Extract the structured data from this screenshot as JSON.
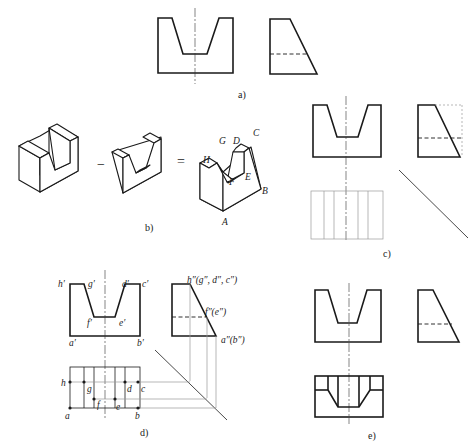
{
  "figure": {
    "panels": [
      {
        "id": "a",
        "caption": "a)"
      },
      {
        "id": "b",
        "caption": "b)"
      },
      {
        "id": "c",
        "caption": "c)"
      },
      {
        "id": "d",
        "caption": "d)"
      },
      {
        "id": "e",
        "caption": "e)"
      }
    ],
    "panel_b": {
      "minus": "−",
      "equals": "=",
      "points": {
        "A": "A",
        "B": "B",
        "C": "C",
        "D": "D",
        "E": "E",
        "F": "F",
        "G": "G",
        "H": "H"
      }
    },
    "panel_d": {
      "front_labels": {
        "h": "h′",
        "g": "g′",
        "d": "d′",
        "c": "c′",
        "f": "f′",
        "e": "e′",
        "a": "a′",
        "b": "b′"
      },
      "side_labels": {
        "top": "h″(g″, d″, c″)",
        "mid": "f″(e″)",
        "bottom": "a″(b″)"
      },
      "top_labels": {
        "h": "h",
        "g": "g",
        "d": "d",
        "c": "c",
        "f": "f",
        "e": "e",
        "a": "a",
        "b": "b"
      }
    }
  }
}
